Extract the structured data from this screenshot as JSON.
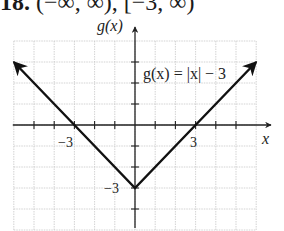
{
  "header": {
    "number": "18.",
    "answer": "(−∞, ∞), [−3, ∞)"
  },
  "chart_data": {
    "type": "line",
    "title": "",
    "function_label": "g(x) = |x| − 3",
    "xlabel": "x",
    "ylabel": "g(x)",
    "xlim": [
      -6,
      6
    ],
    "ylim": [
      -5,
      4
    ],
    "grid": true,
    "tick_labels": {
      "x": [
        "−3",
        "3"
      ],
      "y": [
        "−3"
      ]
    },
    "series": [
      {
        "name": "g(x) = |x| − 3",
        "x": [
          -6,
          -3,
          0,
          3,
          6
        ],
        "y": [
          3,
          0,
          -3,
          0,
          3
        ],
        "arrows_both_ends": true
      }
    ],
    "domain": "(−∞, ∞)",
    "range": "[−3, ∞)"
  },
  "colors": {
    "line": "#111111",
    "grid": "#c8c8c8",
    "axis": "#222222"
  }
}
